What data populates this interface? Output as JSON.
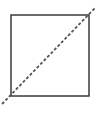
{
  "diagram": {
    "shapes": [
      {
        "type": "square",
        "x": 11,
        "y": 15,
        "width": 78,
        "height": 81,
        "stroke": "#3a3a3a",
        "stroke_width": 1.5,
        "fill": "none"
      },
      {
        "type": "dashed-line",
        "x1": 2,
        "y1": 104,
        "x2": 95,
        "y2": 8,
        "stroke": "#555555",
        "stroke_width": 1.8,
        "dash": "3,2"
      }
    ]
  }
}
